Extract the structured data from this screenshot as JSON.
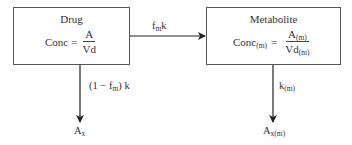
{
  "diagram": {
    "type": "pharmacokinetic-compartment-flow",
    "nodes": [
      {
        "id": "drug",
        "title": "Drug",
        "equation": {
          "lhs": "Conc",
          "lhs_sub": "",
          "equals": "=",
          "numerator": "A",
          "numerator_sub": "",
          "denominator": "Vd",
          "denominator_sub": ""
        }
      },
      {
        "id": "metabolite",
        "title": "Metabolite",
        "equation": {
          "lhs": "Conc",
          "lhs_sub": "(m)",
          "equals": "=",
          "numerator": "A",
          "numerator_sub": "(m)",
          "denominator": "Vd",
          "denominator_sub": "(m)"
        }
      }
    ],
    "edges": [
      {
        "from": "drug",
        "to": "metabolite",
        "label": {
          "base": "f",
          "sub": "m",
          "suffix": "k"
        }
      },
      {
        "from": "drug",
        "to": "drug_excreted",
        "label": {
          "prefix": "(1 − f",
          "sub": "m",
          "suffix": ") k"
        }
      },
      {
        "from": "metabolite",
        "to": "metabolite_excreted",
        "label": {
          "base": "k",
          "sub": "(m)"
        }
      }
    ],
    "sinks": [
      {
        "id": "drug_excreted",
        "base": "A",
        "sub": "x"
      },
      {
        "id": "metabolite_excreted",
        "base": "A",
        "sub": "x(m)"
      }
    ]
  }
}
